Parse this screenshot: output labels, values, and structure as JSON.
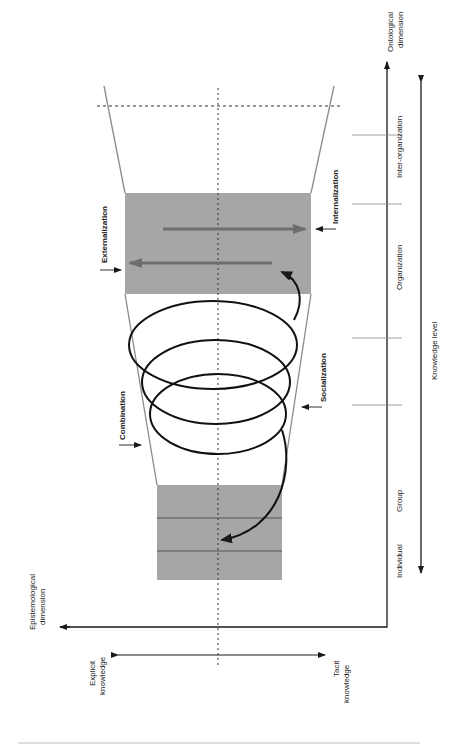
{
  "diagram": {
    "axes": {
      "vertical": {
        "label_line1": "Ontological",
        "label_line2": "dimension"
      },
      "horizontal": {
        "label_line1": "Epistemological",
        "label_line2": "dimension"
      },
      "knowledge_level": "Knowledge level"
    },
    "levels": [
      "Individual",
      "Group",
      "Organization",
      "Inter-organization"
    ],
    "knowledge_types": {
      "explicit_line1": "Explicit",
      "explicit_line2": "knowledge",
      "tacit_line1": "Tacit",
      "tacit_line2": "knowledge"
    },
    "modes": {
      "externalization": "Externalization",
      "internalization": "Internalization",
      "combination": "Combination",
      "socialization": "Socialization"
    },
    "colors": {
      "box_fill": "#a6a6a6",
      "line": "#1a1a1a",
      "arrow_gray": "#6e6e6e",
      "funnel": "#8a8a8a"
    }
  }
}
